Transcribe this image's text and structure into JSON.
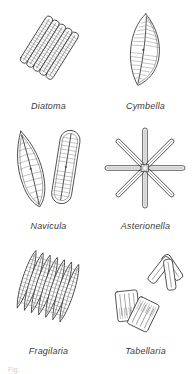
{
  "plate": {
    "background_color": "#ffffff",
    "ink_color": "#333333",
    "hatch_color": "#777777",
    "note_text": "Fig."
  },
  "figures": [
    {
      "id": "diatoma",
      "label": "Diatoma",
      "icon": "diatoma-ribbon-colony-icon",
      "row": 1,
      "column": 1,
      "description": "Ribbon colony of elongate rod cells lying side by side, tilted diagonally"
    },
    {
      "id": "cymbella",
      "label": "Cymbella",
      "icon": "cymbella-crescent-cell-icon",
      "row": 1,
      "column": 2,
      "description": "Single asymmetric crescent-shaped cell with fine transverse striae and a central raphe"
    },
    {
      "id": "navicula",
      "label": "Navicula",
      "icon": "navicula-boat-cell-icon",
      "row": 2,
      "column": 1,
      "description": "Two boat-shaped cells, one in valve view with pointed ends, one in girdle view with rounded ends"
    },
    {
      "id": "asterionella",
      "label": "Asterionella",
      "icon": "asterionella-star-colony-icon",
      "row": 2,
      "column": 2,
      "description": "Star-shaped colony of eight rod cells radiating from a central attachment point"
    },
    {
      "id": "fragilaria",
      "label": "Fragilaria",
      "icon": "fragilaria-ribbon-colony-icon",
      "row": 3,
      "column": 1,
      "description": "Ribbon of narrow spindle-shaped cells joined along their sides, tilted diagonally"
    },
    {
      "id": "tabellaria",
      "label": "Tabellaria",
      "icon": "tabellaria-zigzag-colony-icon",
      "row": 3,
      "column": 2,
      "description": "Two rectangular cells in valve view with internal septa plus a three-armed zigzag chain"
    }
  ]
}
